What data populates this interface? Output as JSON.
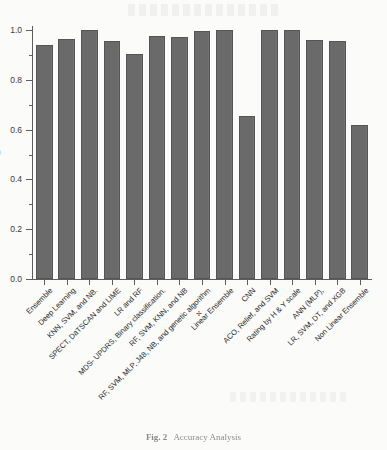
{
  "figure": {
    "caption_label": "Fig. 2",
    "caption_text": "Accuracy Analysis"
  },
  "chart_data": {
    "type": "bar",
    "title": "",
    "xlabel": "",
    "ylabel": "B",
    "ylim": [
      0.0,
      1.0
    ],
    "y_major_ticks": [
      "0.0",
      "0.2",
      "0.4",
      "0.6",
      "0.8",
      "1.0"
    ],
    "y_major_tick_values": [
      0.0,
      0.2,
      0.4,
      0.6,
      0.8,
      1.0
    ],
    "y_minor_tick_values": [
      0.1,
      0.3,
      0.5,
      0.7,
      0.9
    ],
    "grid": false,
    "legend": false,
    "bar_color": "#6a6a6a",
    "bar_edge_color": "#555555",
    "categories": [
      "Ensemble",
      "Deep Learning",
      "KNN, SVM, and NB.",
      "SPECT, DaTSCAN and LIME",
      "LR and RF",
      "MDS- UPDRS, Binary classification.",
      "RF, SVM, KNN, and NB",
      "RF, SVM, MLP, J48, NB, and genetic algorithm",
      "Linear Ensemble",
      "CNN",
      "ACO, Relief, and SVM",
      "Rating by H & Y scale",
      "ANN (MLP),",
      "LR, SVM, DT, and XGB",
      "Non Linear Ensemble"
    ],
    "values": [
      0.94,
      0.965,
      1.0,
      0.955,
      0.905,
      0.975,
      0.97,
      0.995,
      1.0,
      0.655,
      1.0,
      1.0,
      0.96,
      0.955,
      0.62
    ]
  }
}
